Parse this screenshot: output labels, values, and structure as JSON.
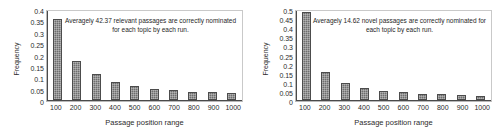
{
  "chart_data": [
    {
      "type": "bar",
      "title": "",
      "panel": "left",
      "xlabel": "Passage position range",
      "ylabel": "Frequency",
      "categories": [
        "100",
        "200",
        "300",
        "400",
        "500",
        "600",
        "700",
        "800",
        "900",
        "1000"
      ],
      "values": [
        0.36,
        0.175,
        0.115,
        0.08,
        0.062,
        0.05,
        0.045,
        0.037,
        0.034,
        0.029
      ],
      "ylim": [
        0,
        0.4
      ],
      "yticks": [
        "0",
        "0.05",
        "0.1",
        "0.15",
        "0.2",
        "0.25",
        "0.3",
        "0.35",
        "0.4"
      ],
      "ytick_values": [
        0,
        0.05,
        0.1,
        0.15,
        0.2,
        0.25,
        0.3,
        0.35,
        0.4
      ],
      "grid": false,
      "legend": "none",
      "annotation": "Averagely 42.37 relevant passages are correctly nominated for each topic by each run.",
      "bar_color": "#6e6e6e"
    },
    {
      "type": "bar",
      "title": "",
      "panel": "right",
      "xlabel": "Passage position range",
      "ylabel": "Frequency",
      "categories": [
        "100",
        "200",
        "300",
        "400",
        "500",
        "600",
        "700",
        "800",
        "900",
        "1000"
      ],
      "values": [
        0.487,
        0.153,
        0.097,
        0.067,
        0.051,
        0.042,
        0.036,
        0.033,
        0.028,
        0.025
      ],
      "ylim": [
        0,
        0.5
      ],
      "yticks": [
        "0",
        "0.05",
        "0.1",
        "0.15",
        "0.2",
        "0.25",
        "0.3",
        "0.35",
        "0.4",
        "0.45",
        "0.5"
      ],
      "ytick_values": [
        0,
        0.05,
        0.1,
        0.15,
        0.2,
        0.25,
        0.3,
        0.35,
        0.4,
        0.45,
        0.5
      ],
      "grid": false,
      "legend": "none",
      "annotation": "Averagely 14.62 novel passages are correctly nominated for each topic by each run.",
      "bar_color": "#6e6e6e"
    }
  ]
}
